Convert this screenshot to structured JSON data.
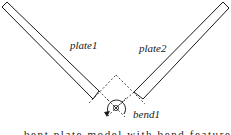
{
  "diagram": {
    "labels": {
      "plate1": "plate1",
      "plate2": "plate2",
      "bend1": "bend1"
    },
    "caption_clipped": "bent plate model with bend feature",
    "colors": {
      "stroke": "#1a1a1a",
      "background": "#ffffff"
    }
  }
}
